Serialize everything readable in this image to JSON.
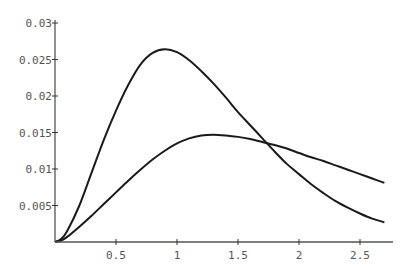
{
  "chart_data": {
    "type": "line",
    "title": "",
    "xlabel": "",
    "ylabel": "",
    "xlim": [
      0,
      2.77
    ],
    "ylim": [
      0,
      0.03
    ],
    "grid": false,
    "legend": null,
    "x_ticks": [
      {
        "value": 0.5,
        "label": "0.5"
      },
      {
        "value": 1,
        "label": "1"
      },
      {
        "value": 1.5,
        "label": "1.5"
      },
      {
        "value": 2,
        "label": "2"
      },
      {
        "value": 2.5,
        "label": "2.5"
      }
    ],
    "y_ticks": [
      {
        "value": 0.005,
        "label": "0.005"
      },
      {
        "value": 0.01,
        "label": "0.01"
      },
      {
        "value": 0.015,
        "label": "0.015"
      },
      {
        "value": 0.02,
        "label": "0.02"
      },
      {
        "value": 0.025,
        "label": "0.025"
      },
      {
        "value": 0.03,
        "label": "0.03"
      }
    ],
    "series": [
      {
        "name": "curve-1",
        "x": [
          0.0,
          0.05,
          0.1,
          0.2,
          0.3,
          0.4,
          0.5,
          0.6,
          0.7,
          0.8,
          0.9,
          1.0,
          1.1,
          1.2,
          1.3,
          1.4,
          1.5,
          1.6,
          1.7,
          1.8,
          1.9,
          2.0,
          2.1,
          2.2,
          2.3,
          2.4,
          2.5,
          2.6,
          2.7
        ],
        "y": [
          0.0,
          0.0004,
          0.0015,
          0.005,
          0.0095,
          0.014,
          0.018,
          0.0215,
          0.0243,
          0.0259,
          0.0264,
          0.026,
          0.0249,
          0.0234,
          0.0217,
          0.0198,
          0.0178,
          0.016,
          0.0142,
          0.0124,
          0.0107,
          0.0093,
          0.0079,
          0.0067,
          0.0056,
          0.0047,
          0.0039,
          0.0032,
          0.0027
        ]
      },
      {
        "name": "curve-2",
        "x": [
          0.0,
          0.05,
          0.1,
          0.2,
          0.3,
          0.4,
          0.5,
          0.6,
          0.7,
          0.8,
          0.9,
          1.0,
          1.1,
          1.2,
          1.3,
          1.4,
          1.5,
          1.6,
          1.7,
          1.8,
          1.9,
          2.0,
          2.1,
          2.2,
          2.3,
          2.4,
          2.5,
          2.6,
          2.7
        ],
        "y": [
          0.0,
          0.0002,
          0.0007,
          0.0021,
          0.0036,
          0.0052,
          0.0068,
          0.0084,
          0.0099,
          0.0113,
          0.0125,
          0.0135,
          0.0142,
          0.0146,
          0.0147,
          0.0146,
          0.0144,
          0.0141,
          0.0137,
          0.0133,
          0.0128,
          0.0122,
          0.0116,
          0.0111,
          0.0105,
          0.0099,
          0.0093,
          0.0087,
          0.0081
        ]
      }
    ]
  }
}
